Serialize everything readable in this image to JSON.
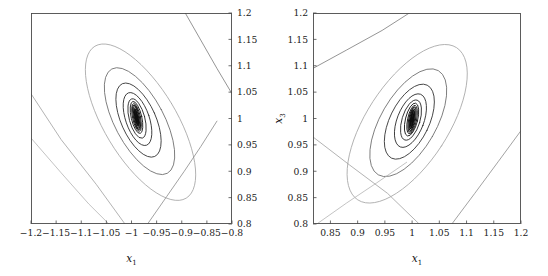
{
  "figure": {
    "background": "#ffffff",
    "panel_count": 2
  },
  "chart_data": [
    {
      "type": "line",
      "subtype": "contour",
      "panel": "left",
      "title": "",
      "xlabel": "x1",
      "ylabel": "",
      "xlabel_display": "x",
      "xlabel_sub": "1",
      "ylabel_display": "",
      "ylabel_sub": "",
      "xlim": [
        -1.2,
        -0.8
      ],
      "ylim": [
        0.8,
        1.2
      ],
      "xticks": [
        -1.2,
        -1.15,
        -1.1,
        -1.05,
        -1,
        -0.95,
        -0.9,
        -0.85,
        -0.8
      ],
      "xticklabels": [
        "−1.2",
        "−1.15",
        "−1.1",
        "−1.05",
        "−1",
        "−0.95",
        "−0.9",
        "−0.85",
        "−0.8"
      ],
      "yticks": [
        0.8,
        0.85,
        0.9,
        0.95,
        1.0,
        1.05,
        1.1,
        1.15,
        1.2
      ],
      "yticklabels": [
        "0.8",
        "0.85",
        "0.9",
        "0.95",
        "1",
        "1.05",
        "1.1",
        "1.15",
        "1.2"
      ],
      "ytick_side": "right",
      "xtick_side": "bottom",
      "grid": false,
      "legend": null,
      "minimum": [
        -1.0,
        1.0
      ],
      "contours": [
        {
          "level": 1,
          "color": "#111111",
          "width": 1.0,
          "cx": -0.99,
          "cy": 1.002,
          "rx": 0.0025,
          "ry": 0.017,
          "angle": -12
        },
        {
          "level": 2,
          "color": "#111111",
          "width": 1.0,
          "cx": -0.99,
          "cy": 1.002,
          "rx": 0.0042,
          "ry": 0.0205,
          "angle": -12
        },
        {
          "level": 3,
          "color": "#161616",
          "width": 0.95,
          "cx": -0.99,
          "cy": 1.002,
          "rx": 0.0058,
          "ry": 0.0235,
          "angle": -12
        },
        {
          "level": 4,
          "color": "#1c1c1c",
          "width": 0.9,
          "cx": -0.99,
          "cy": 1.002,
          "rx": 0.0078,
          "ry": 0.0268,
          "angle": -12
        },
        {
          "level": 5,
          "color": "#222222",
          "width": 0.9,
          "cx": -0.99,
          "cy": 1.002,
          "rx": 0.0105,
          "ry": 0.031,
          "angle": -13
        },
        {
          "level": 6,
          "color": "#2a2a2a",
          "width": 0.85,
          "cx": -0.989,
          "cy": 1.0,
          "rx": 0.0155,
          "ry": 0.0385,
          "angle": -15
        },
        {
          "level": 7,
          "color": "#333333",
          "width": 0.85,
          "cx": -0.988,
          "cy": 0.999,
          "rx": 0.0235,
          "ry": 0.0525,
          "angle": -19
        },
        {
          "level": 8,
          "color": "#3d3d3d",
          "width": 0.85,
          "cx": -0.986,
          "cy": 0.997,
          "rx": 0.0345,
          "ry": 0.0755,
          "angle": -24
        },
        {
          "level": 9,
          "color": "#6e6e6e",
          "width": 0.8,
          "cx": -0.984,
          "cy": 0.995,
          "rx": 0.049,
          "ry": 0.112,
          "angle": -28
        },
        {
          "level": 10,
          "color": "#a8a8a8",
          "width": 0.8,
          "cx": -0.982,
          "cy": 0.993,
          "rx": 0.072,
          "ry": 0.168,
          "angle": -31
        }
      ],
      "open_branches": [
        {
          "color": "#7a7a7a",
          "width": 0.8,
          "points": [
            [
              -0.893,
              1.2
            ],
            [
              -0.86,
              1.145
            ],
            [
              -0.83,
              1.095
            ],
            [
              -0.8,
              1.047
            ]
          ]
        },
        {
          "color": "#a0a0a0",
          "width": 0.8,
          "points": [
            [
              -1.2,
              1.047
            ],
            [
              -1.14,
              0.96
            ],
            [
              -1.07,
              0.875
            ],
            [
              -1.013,
              0.8
            ]
          ]
        },
        {
          "color": "#b4b4b4",
          "width": 0.8,
          "points": [
            [
              -1.2,
              0.963
            ],
            [
              -1.14,
              0.897
            ],
            [
              -1.085,
              0.838
            ],
            [
              -1.045,
              0.8
            ]
          ]
        },
        {
          "color": "#8a8a8a",
          "width": 0.8,
          "points": [
            [
              -0.968,
              0.8
            ],
            [
              -0.93,
              0.852
            ],
            [
              -0.895,
              0.9
            ],
            [
              -0.862,
              0.947
            ],
            [
              -0.83,
              0.995
            ]
          ]
        }
      ]
    },
    {
      "type": "line",
      "subtype": "contour",
      "panel": "right",
      "title": "",
      "xlabel": "x1",
      "ylabel": "x3",
      "xlabel_display": "x",
      "xlabel_sub": "1",
      "ylabel_display": "x",
      "ylabel_sub": "3",
      "xlim": [
        0.818,
        1.2
      ],
      "ylim": [
        0.8,
        1.2
      ],
      "xticks": [
        0.85,
        0.9,
        0.95,
        1,
        1.05,
        1.1,
        1.15,
        1.2
      ],
      "xticklabels": [
        "0.85",
        "0.9",
        "0.95",
        "1",
        "1.05",
        "1.1",
        "1.15",
        "1.2"
      ],
      "yticks": [
        0.8,
        0.85,
        0.9,
        0.95,
        1.0,
        1.05,
        1.1,
        1.15,
        1.2
      ],
      "yticklabels": [
        "0.8",
        "0.85",
        "0.9",
        "0.95",
        "1",
        "1.05",
        "1.1",
        "1.15",
        "1.2"
      ],
      "ytick_side": "left",
      "xtick_side": "bottom",
      "grid": false,
      "legend": null,
      "minimum": [
        1.0,
        1.0
      ],
      "contours": [
        {
          "level": 1,
          "color": "#111111",
          "width": 1.0,
          "cx": 1.0,
          "cy": 0.998,
          "rx": 0.0028,
          "ry": 0.0175,
          "angle": 10
        },
        {
          "level": 2,
          "color": "#111111",
          "width": 1.0,
          "cx": 1.0,
          "cy": 0.998,
          "rx": 0.0045,
          "ry": 0.021,
          "angle": 10
        },
        {
          "level": 3,
          "color": "#161616",
          "width": 0.95,
          "cx": 1.0,
          "cy": 0.998,
          "rx": 0.0062,
          "ry": 0.0242,
          "angle": 11
        },
        {
          "level": 4,
          "color": "#1c1c1c",
          "width": 0.9,
          "cx": 1.0,
          "cy": 0.998,
          "rx": 0.0082,
          "ry": 0.0275,
          "angle": 12
        },
        {
          "level": 5,
          "color": "#222222",
          "width": 0.9,
          "cx": 0.999,
          "cy": 0.998,
          "rx": 0.0112,
          "ry": 0.032,
          "angle": 14
        },
        {
          "level": 6,
          "color": "#2a2a2a",
          "width": 0.85,
          "cx": 0.998,
          "cy": 0.997,
          "rx": 0.0165,
          "ry": 0.0395,
          "angle": 17
        },
        {
          "level": 7,
          "color": "#333333",
          "width": 0.85,
          "cx": 0.997,
          "cy": 0.996,
          "rx": 0.0245,
          "ry": 0.0535,
          "angle": 21
        },
        {
          "level": 8,
          "color": "#3d3d3d",
          "width": 0.85,
          "cx": 0.995,
          "cy": 0.994,
          "rx": 0.036,
          "ry": 0.077,
          "angle": 26
        },
        {
          "level": 9,
          "color": "#6e6e6e",
          "width": 0.8,
          "cx": 0.993,
          "cy": 0.992,
          "rx": 0.051,
          "ry": 0.114,
          "angle": 30
        },
        {
          "level": 10,
          "color": "#a8a8a8",
          "width": 0.8,
          "cx": 0.991,
          "cy": 0.99,
          "rx": 0.075,
          "ry": 0.172,
          "angle": 33
        }
      ],
      "open_branches": [
        {
          "color": "#7a7a7a",
          "width": 0.8,
          "points": [
            [
              0.818,
              1.095
            ],
            [
              0.88,
              1.13
            ],
            [
              0.945,
              1.167
            ],
            [
              0.995,
              1.2
            ]
          ]
        },
        {
          "color": "#a0a0a0",
          "width": 0.8,
          "points": [
            [
              0.818,
              0.965
            ],
            [
              0.885,
              0.912
            ],
            [
              0.955,
              0.858
            ],
            [
              1.013,
              0.8
            ]
          ]
        },
        {
          "color": "#b4b4b4",
          "width": 0.8,
          "points": [
            [
              0.825,
              0.8
            ],
            [
              0.88,
              0.84
            ],
            [
              0.935,
              0.878
            ],
            [
              0.99,
              0.917
            ]
          ]
        },
        {
          "color": "#8a8a8a",
          "width": 0.8,
          "points": [
            [
              1.073,
              0.8
            ],
            [
              1.115,
              0.858
            ],
            [
              1.158,
              0.918
            ],
            [
              1.2,
              0.977
            ]
          ]
        }
      ]
    }
  ]
}
